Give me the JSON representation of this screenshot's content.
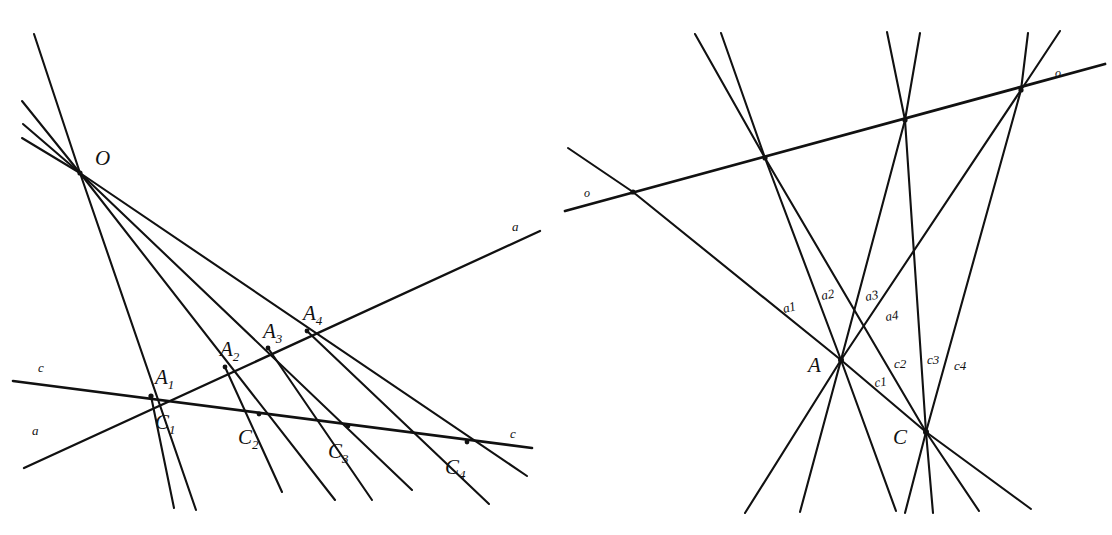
{
  "figure": {
    "background_color": "#ffffff",
    "ink_color": "#111111",
    "canvas": {
      "width": 1112,
      "height": 535
    },
    "panels": [
      {
        "id": "left-panel",
        "name": "pencil-of-lines-from-center-O",
        "center_point": {
          "label": "O",
          "x": 80,
          "y": 173,
          "label_x": 96,
          "label_y": 164
        },
        "upper_rays": [
          {
            "name": "ray-up-1",
            "x2": 34,
            "y2": 34
          },
          {
            "name": "ray-up-2",
            "x2": 22,
            "y2": 101
          },
          {
            "name": "ray-up-3",
            "x2": 23,
            "y2": 124
          },
          {
            "name": "ray-up-4",
            "x2": 22,
            "y2": 138
          }
        ],
        "lower_rays": [
          {
            "name": "ray-OA1",
            "x2": 196,
            "y2": 510
          },
          {
            "name": "ray-OA1-through",
            "x2": 151,
            "y2": 396
          },
          {
            "name": "ray-OA2",
            "x2": 335,
            "y2": 500
          },
          {
            "name": "ray-OA3",
            "x2": 412,
            "y2": 490
          },
          {
            "name": "ray-OA4",
            "x2": 527,
            "y2": 476
          }
        ],
        "line_a": {
          "name": "line-a",
          "label": "a",
          "label_left": "a",
          "label_left_x": 33,
          "label_left_y": 434,
          "label_right": "a",
          "label_right_x": 513,
          "label_right_y": 230,
          "x1": 24,
          "y1": 468,
          "x2": 540,
          "y2": 231
        },
        "line_c": {
          "name": "line-c",
          "label_left": "c",
          "label_left_x": 38,
          "label_left_y": 372,
          "label_right": "c",
          "label_right_x": 511,
          "label_right_y": 437,
          "x1": 13,
          "y1": 381,
          "x2": 532,
          "y2": 448
        },
        "points_a": [
          {
            "label": "A",
            "sub": "1",
            "x": 151,
            "y": 396,
            "label_x": 157,
            "label_y": 382
          },
          {
            "label": "A",
            "sub": "2",
            "x": 225,
            "y": 367,
            "label_x": 222,
            "label_y": 354
          },
          {
            "label": "A",
            "sub": "3",
            "x": 268,
            "y": 348,
            "label_x": 265,
            "label_y": 336
          },
          {
            "label": "A",
            "sub": "4",
            "x": 307,
            "y": 331,
            "label_x": 305,
            "label_y": 318
          }
        ],
        "points_c": [
          {
            "label": "C",
            "sub": "1",
            "x": 151,
            "y": 396,
            "label_x": 156,
            "label_y": 428
          },
          {
            "label": "C",
            "sub": "2",
            "x": 259,
            "y": 414,
            "label_x": 240,
            "label_y": 442
          },
          {
            "label": "C",
            "sub": "3",
            "x": 348,
            "y": 426,
            "label_x": 330,
            "label_y": 457
          },
          {
            "label": "C",
            "sub": "4",
            "x": 467,
            "y": 442,
            "label_x": 447,
            "label_y": 472
          }
        ],
        "connector_lines": [
          {
            "name": "connector-A2-C1",
            "x1": 225,
            "y1": 367,
            "x2": 130,
            "y2": 403
          },
          {
            "name": "connector-A2-C2-down",
            "x1": 225,
            "y1": 367,
            "x2": 282,
            "y2": 490
          },
          {
            "name": "connector-A3-C1",
            "x1": 268,
            "y1": 348,
            "x2": 145,
            "y2": 395
          },
          {
            "name": "connector-A3-down",
            "x1": 268,
            "y1": 348,
            "x2": 370,
            "y2": 498
          },
          {
            "name": "connector-A4-C1",
            "x1": 307,
            "y1": 331,
            "x2": 148,
            "y2": 393
          },
          {
            "name": "connector-A4-down",
            "x1": 307,
            "y1": 331,
            "x2": 487,
            "y2": 502
          },
          {
            "name": "connector-C1-down",
            "x1": 151,
            "y1": 396,
            "x2": 172,
            "y2": 506
          }
        ]
      },
      {
        "id": "right-panel",
        "name": "dual-figure-pencils-at-A-and-C",
        "point_A": {
          "label": "A",
          "x": 841,
          "y": 360,
          "label_x": 812,
          "label_y": 371
        },
        "point_C": {
          "label": "C",
          "x": 926,
          "y": 432,
          "label_x": 897,
          "label_y": 443
        },
        "line_o": {
          "name": "line-o",
          "label_left": "o",
          "label_left_x": 585,
          "label_left_y": 196,
          "label_right": "o",
          "label_right_x": 1058,
          "label_right_y": 76,
          "x1": 565,
          "y1": 211,
          "x2": 1105,
          "y2": 64
        },
        "line_o_points": [
          {
            "name": "o-point-1",
            "x": 633,
            "y": 192
          },
          {
            "name": "o-point-2",
            "x": 765,
            "y": 158
          },
          {
            "name": "o-point-3",
            "x": 905,
            "y": 120
          },
          {
            "name": "o-point-4",
            "x": 1021,
            "y": 90
          }
        ],
        "a_lines": [
          {
            "label": "a1",
            "label_x": 788,
            "label_y": 312,
            "x1": 841,
            "y1": 360,
            "x2": 633,
            "y2": 192
          },
          {
            "label": "a2",
            "label_x": 826,
            "label_y": 299,
            "x1": 841,
            "y1": 360,
            "x2": 765,
            "y2": 158
          },
          {
            "label": "a3",
            "label_x": 869,
            "label_y": 300,
            "x1": 841,
            "y1": 360,
            "x2": 905,
            "y2": 120
          },
          {
            "label": "a4",
            "label_x": 889,
            "label_y": 319,
            "x1": 841,
            "y1": 360,
            "x2": 1021,
            "y2": 90
          }
        ],
        "c_lines": [
          {
            "label": "c1",
            "label_x": 878,
            "label_y": 385,
            "x1": 926,
            "y1": 432,
            "x2": 841,
            "y2": 360
          },
          {
            "label": "c2",
            "label_x": 897,
            "label_y": 366,
            "x1": 926,
            "y1": 432,
            "x2": 765,
            "y2": 158
          },
          {
            "label": "c3",
            "label_x": 930,
            "label_y": 362,
            "x1": 926,
            "y1": 432,
            "x2": 905,
            "y2": 120
          },
          {
            "label": "c4",
            "label_x": 957,
            "label_y": 368,
            "x1": 926,
            "y1": 432,
            "x2": 1021,
            "y2": 90
          }
        ],
        "upper_rays": [
          {
            "name": "upper-ray-1",
            "x1": 765,
            "y1": 158,
            "x2": 695,
            "y2": 34
          },
          {
            "name": "upper-ray-2",
            "x1": 765,
            "y1": 158,
            "x2": 720,
            "y2": 33
          },
          {
            "name": "upper-ray-3",
            "x1": 905,
            "y1": 120,
            "x2": 887,
            "y2": 32
          },
          {
            "name": "upper-ray-4",
            "x1": 905,
            "y1": 120,
            "x2": 919,
            "y2": 33
          },
          {
            "name": "upper-ray-5",
            "x1": 1021,
            "y1": 90,
            "x2": 1028,
            "y2": 33
          },
          {
            "name": "upper-ray-6",
            "x1": 1021,
            "y1": 90,
            "x2": 1059,
            "y2": 31
          },
          {
            "name": "upper-ray-7",
            "x1": 633,
            "y1": 192,
            "x2": 568,
            "y2": 148
          }
        ],
        "lower_rays_A": [
          {
            "name": "A-lower-ray-1",
            "x1": 841,
            "y1": 360,
            "x2": 745,
            "y2": 512
          },
          {
            "name": "A-lower-ray-2",
            "x1": 841,
            "y1": 360,
            "x2": 800,
            "y2": 511
          },
          {
            "name": "A-lower-ray-3",
            "x1": 841,
            "y1": 360,
            "x2": 895,
            "y2": 510
          }
        ],
        "lower_rays_C": [
          {
            "name": "C-lower-ray-1",
            "x1": 926,
            "y1": 432,
            "x2": 904,
            "y2": 512
          },
          {
            "name": "C-lower-ray-2",
            "x1": 926,
            "y1": 432,
            "x2": 932,
            "y2": 512
          },
          {
            "name": "C-lower-ray-3",
            "x1": 926,
            "y1": 432,
            "x2": 978,
            "y2": 510
          },
          {
            "name": "C-lower-ray-4",
            "x1": 926,
            "y1": 432,
            "x2": 1030,
            "y2": 508
          }
        ]
      }
    ]
  }
}
